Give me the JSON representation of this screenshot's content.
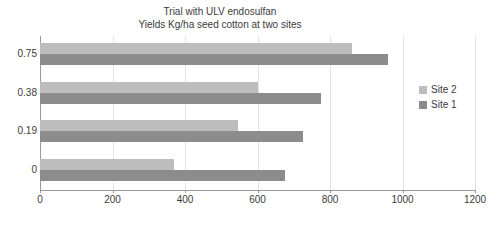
{
  "chart_data": {
    "type": "bar",
    "orientation": "horizontal",
    "title": "Trial with ULV endosulfan",
    "subtitle": "Yields Kg/ha seed cotton at two sites",
    "xlabel": "",
    "ylabel": "",
    "categories": [
      "0.75",
      "0.38",
      "0.19",
      "0"
    ],
    "series": [
      {
        "name": "Site 2",
        "color": "#bdbdbd",
        "values": [
          860,
          600,
          545,
          370
        ]
      },
      {
        "name": "Site 1",
        "color": "#8c8c8c",
        "values": [
          960,
          775,
          725,
          675
        ]
      }
    ],
    "xlim": [
      0,
      1200
    ],
    "xticks": [
      0,
      200,
      400,
      600,
      800,
      1000,
      1200
    ],
    "xtick_labels": [
      "0",
      "200",
      "400",
      "600",
      "800",
      "1000",
      "1200"
    ],
    "grid": true,
    "grid_axis": "x",
    "legend_position": "right"
  },
  "legend": {
    "items": [
      {
        "label": "Site 2",
        "color": "#bdbdbd"
      },
      {
        "label": "Site 1",
        "color": "#8c8c8c"
      }
    ]
  },
  "colors": {
    "site2": "#bdbdbd",
    "site1": "#8c8c8c",
    "axis": "#9a9a9a",
    "grid": "#e3e3e3",
    "text": "#3b3b3b",
    "background": "#ffffff"
  }
}
